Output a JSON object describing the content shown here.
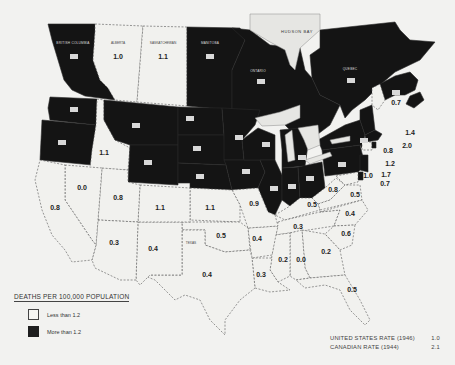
{
  "legend": {
    "title": "DEATHS PER 100,000 POPULATION",
    "items": [
      {
        "label": "Less than 1.2",
        "category": "light"
      },
      {
        "label": "More than 1.2",
        "category": "dark"
      }
    ]
  },
  "rates": [
    {
      "label": "UNITED STATES RATE (1946)",
      "value": "1.0"
    },
    {
      "label": "CANADIAN RATE (1944)",
      "value": "2.1"
    }
  ],
  "water_labels": {
    "hudson_bay": "HUDSON BAY"
  },
  "regions": {
    "alberta": {
      "name": "ALBERTA",
      "value": "1.0",
      "category": "light"
    },
    "saskatchewan": {
      "name": "SASKATCHEWAN",
      "value": "1.1",
      "category": "light"
    },
    "british_columbia": {
      "name": "BRITISH COLUMBIA",
      "value": "",
      "category": "dark"
    },
    "manitoba": {
      "name": "MANITOBA",
      "value": "",
      "category": "dark"
    },
    "ontario": {
      "name": "ONTARIO",
      "value": "",
      "category": "dark"
    },
    "quebec": {
      "name": "QUEBEC",
      "value": "",
      "category": "dark"
    },
    "maritimes": {
      "name": "",
      "value": "",
      "category": "dark"
    },
    "idaho": {
      "name": "",
      "value": "1.1",
      "category": "light"
    },
    "nevada": {
      "name": "",
      "value": "0.0",
      "category": "light"
    },
    "california": {
      "name": "",
      "value": "0.8",
      "category": "light"
    },
    "utah": {
      "name": "",
      "value": "0.8",
      "category": "light"
    },
    "colorado": {
      "name": "",
      "value": "1.1",
      "category": "light"
    },
    "kansas": {
      "name": "",
      "value": "1.1",
      "category": "light"
    },
    "arizona": {
      "name": "",
      "value": "0.3",
      "category": "light"
    },
    "new_mexico": {
      "name": "",
      "value": "0.4",
      "category": "light"
    },
    "oklahoma": {
      "name": "",
      "value": "0.5",
      "category": "light"
    },
    "texas": {
      "name": "TEXAS",
      "value": "0.4",
      "category": "light"
    },
    "missouri": {
      "name": "",
      "value": "0.9",
      "category": "light"
    },
    "arkansas": {
      "name": "",
      "value": "0.4",
      "category": "light"
    },
    "louisiana": {
      "name": "",
      "value": "0.3",
      "category": "light"
    },
    "mississippi": {
      "name": "",
      "value": "0.2",
      "category": "light"
    },
    "alabama": {
      "name": "",
      "value": "0.0",
      "category": "light"
    },
    "georgia": {
      "name": "",
      "value": "0.2",
      "category": "light"
    },
    "florida": {
      "name": "",
      "value": "0.5",
      "category": "light"
    },
    "tennessee": {
      "name": "",
      "value": "0.3",
      "category": "light"
    },
    "kentucky": {
      "name": "",
      "value": "0.5",
      "category": "light"
    },
    "south_carolina": {
      "name": "",
      "value": "0.6",
      "category": "light"
    },
    "north_carolina": {
      "name": "",
      "value": "0.4",
      "category": "light"
    },
    "virginia": {
      "name": "",
      "value": "0.5",
      "category": "light"
    },
    "west_virginia": {
      "name": "",
      "value": "0.8",
      "category": "light"
    },
    "maine": {
      "name": "",
      "value": "0.7",
      "category": "light"
    },
    "massachusetts": {
      "name": "",
      "value": "1.4",
      "category": "dark"
    },
    "rhode_island": {
      "name": "",
      "value": "2.0",
      "category": "dark"
    },
    "connecticut": {
      "name": "",
      "value": "0.8",
      "category": "light"
    },
    "new_jersey": {
      "name": "",
      "value": "1.2",
      "category": "dark"
    },
    "delaware": {
      "name": "",
      "value": "1.7",
      "category": "dark"
    },
    "maryland": {
      "name": "",
      "value": "0.7",
      "category": "light"
    },
    "dc": {
      "name": "",
      "value": "1.0",
      "category": "light"
    },
    "washington": {
      "name": "",
      "value": "",
      "category": "dark"
    },
    "oregon": {
      "name": "",
      "value": "",
      "category": "dark"
    },
    "montana": {
      "name": "",
      "value": "",
      "category": "dark"
    },
    "wyoming": {
      "name": "",
      "value": "",
      "category": "dark"
    },
    "north_dakota": {
      "name": "",
      "value": "",
      "category": "dark"
    },
    "south_dakota": {
      "name": "",
      "value": "",
      "category": "dark"
    },
    "nebraska": {
      "name": "",
      "value": "",
      "category": "dark"
    },
    "minnesota": {
      "name": "",
      "value": "",
      "category": "dark"
    },
    "iowa": {
      "name": "",
      "value": "",
      "category": "dark"
    },
    "wisconsin": {
      "name": "",
      "value": "",
      "category": "dark"
    },
    "illinois": {
      "name": "",
      "value": "",
      "category": "dark"
    },
    "indiana": {
      "name": "",
      "value": "",
      "category": "dark"
    },
    "michigan": {
      "name": "",
      "value": "",
      "category": "dark"
    },
    "ohio": {
      "name": "",
      "value": "",
      "category": "dark"
    },
    "pennsylvania": {
      "name": "",
      "value": "",
      "category": "dark"
    },
    "new_york": {
      "name": "",
      "value": "",
      "category": "dark"
    },
    "vermont_nh": {
      "name": "",
      "value": "",
      "category": "dark"
    }
  },
  "colors": {
    "light": "#f1f1ee",
    "dark": "#141414",
    "background": "#f2f2f0"
  }
}
